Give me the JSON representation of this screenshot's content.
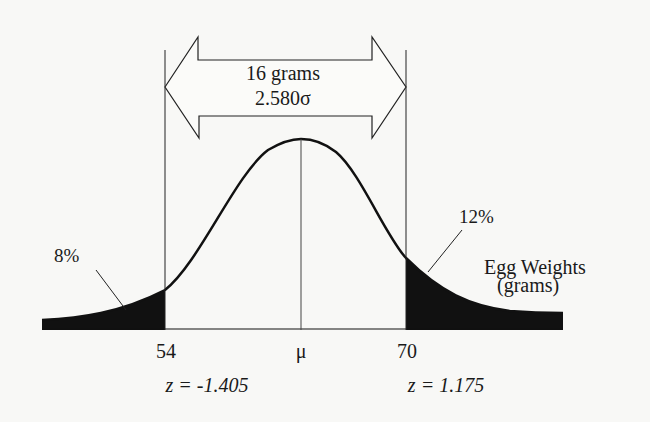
{
  "diagram": {
    "span": {
      "width_label": "16 grams",
      "sigma_label": "2.580σ"
    },
    "tails": {
      "left_percent": "8%",
      "right_percent": "12%"
    },
    "axis": {
      "label_line1": "Egg Weights",
      "label_line2": "(grams)",
      "left_value": "54",
      "mean_label": "μ",
      "right_value": "70",
      "left_z": "z = -1.405",
      "right_z": "z = 1.175"
    },
    "colors": {
      "ink": "#1a1a1a",
      "background": "#f8f8f6"
    }
  }
}
